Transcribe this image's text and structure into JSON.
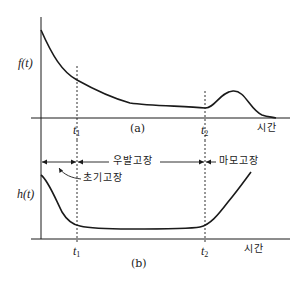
{
  "figure": {
    "panel_a": {
      "ylabel": "f(t)",
      "caption": "(a)",
      "xlabel": "시간",
      "t1_label": "t",
      "t1_sub": "1",
      "t2_label": "t",
      "t2_sub": "2"
    },
    "panel_b": {
      "ylabel": "h(t)",
      "caption": "(b)",
      "xlabel": "시간",
      "t1_label": "t",
      "t1_sub": "1",
      "t2_label": "t",
      "t2_sub": "2",
      "regions": {
        "early": "초기고장",
        "random": "우발고장",
        "wearout": "마모고장"
      }
    },
    "colors": {
      "line": "#1a1a1a",
      "background": "#ffffff"
    }
  }
}
